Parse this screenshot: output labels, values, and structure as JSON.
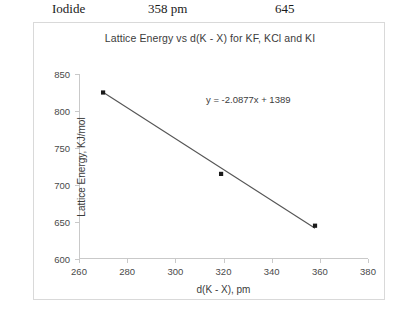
{
  "table_fragment": {
    "name": "Iodide",
    "distance": "358 pm",
    "energy": "645"
  },
  "chart_data": {
    "type": "scatter",
    "title": "Lattice Energy vs d(K - X) for KF, KCl and KI",
    "xlabel": "d(K - X), pm",
    "ylabel": "Lattice Energy, KJ/mol",
    "x": [
      270,
      319,
      358
    ],
    "values": [
      825,
      715,
      645
    ],
    "point_labels": [
      "KF",
      "KCl",
      "KI"
    ],
    "xlim": [
      260,
      380
    ],
    "ylim": [
      600,
      850
    ],
    "xticks": [
      260,
      280,
      300,
      320,
      340,
      360,
      380
    ],
    "yticks": [
      600,
      650,
      700,
      750,
      800,
      850
    ],
    "grid": false,
    "legend": "none",
    "annotation": "y = -2.0877x + 1389",
    "trendline": {
      "slope": -2.0877,
      "intercept": 1389
    },
    "marker_color": "#1a1a1a",
    "line_color": "#555555",
    "frame_color": "#d9d9d9",
    "axis_color": "#c9c9c9"
  }
}
